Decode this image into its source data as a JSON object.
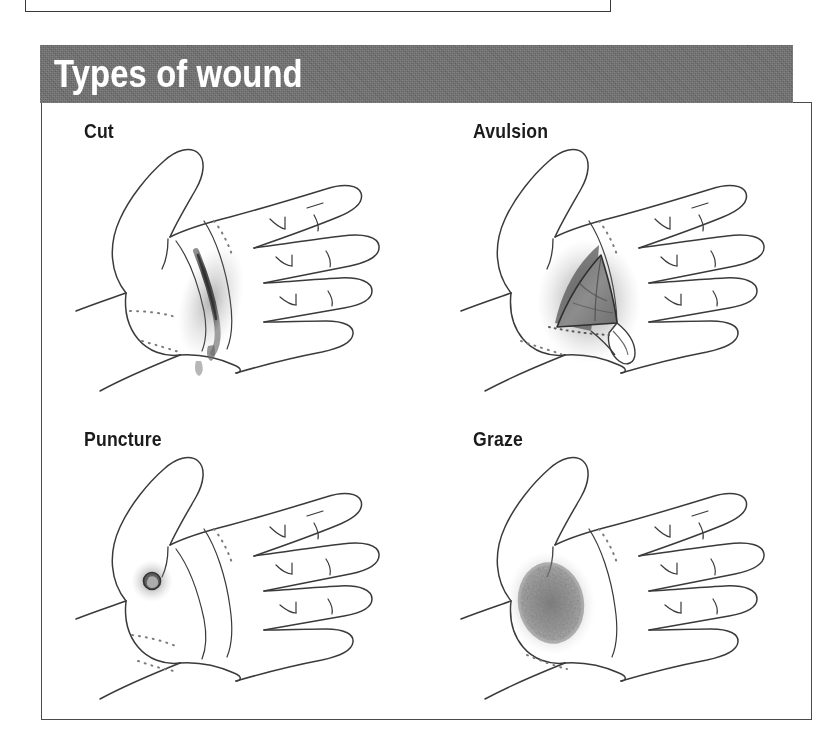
{
  "figure": {
    "header_title": "Types of wound",
    "header_bg": "#6f6f6f",
    "header_text_color": "#ffffff",
    "panel_border_color": "#4a4a4a",
    "background": "#ffffff",
    "ink_color": "#3a3a3a"
  },
  "items": [
    {
      "id": "cut",
      "label": "Cut",
      "wound_type": "linear-incision",
      "wound_description": "dark diagonal slit across the palm with soft blood shading"
    },
    {
      "id": "avulsion",
      "label": "Avulsion",
      "wound_type": "skin-flap",
      "wound_description": "triangular flap of skin torn back from the palm, dark shaded cavity"
    },
    {
      "id": "puncture",
      "label": "Puncture",
      "wound_type": "point-entry",
      "wound_description": "small round dark entry hole on the thumb mound with bruised halo"
    },
    {
      "id": "graze",
      "label": "Graze",
      "wound_type": "abrasion",
      "wound_description": "diffuse stippled abraded patch over the thumb mound"
    }
  ]
}
